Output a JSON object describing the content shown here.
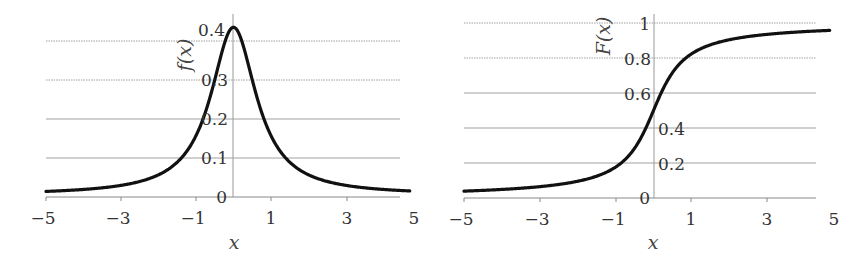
{
  "chart_data": [
    {
      "type": "line",
      "title": "",
      "xlabel": "x",
      "ylabel": "f(x)",
      "xlim": [
        -5,
        5
      ],
      "ylim": [
        0,
        0.43
      ],
      "x_ticks": [
        "−5",
        "−3",
        "−1",
        "1",
        "3",
        "5"
      ],
      "y_ticks": [
        "0",
        "0.1",
        "0.2",
        "0.3",
        "0.4"
      ],
      "grid": "horizontal",
      "legend": "none",
      "series": [
        {
          "name": "f(x)",
          "description": "Symmetric bell-shaped density with heavy tails (Cauchy-like), peak ~0.43 at x ≈ 0",
          "x": [
            -5,
            -4,
            -3,
            -2,
            -1.5,
            -1,
            -0.5,
            0,
            0.5,
            1,
            1.5,
            2,
            3,
            4,
            4.7
          ],
          "y": [
            0.012,
            0.018,
            0.03,
            0.06,
            0.09,
            0.14,
            0.27,
            0.43,
            0.27,
            0.14,
            0.09,
            0.06,
            0.03,
            0.018,
            0.014
          ]
        }
      ]
    },
    {
      "type": "line",
      "title": "",
      "xlabel": "x",
      "ylabel": "F(x)",
      "xlim": [
        -5,
        5
      ],
      "ylim": [
        0,
        1
      ],
      "x_ticks": [
        "−5",
        "−3",
        "−1",
        "1",
        "3",
        "5"
      ],
      "y_ticks": [
        "0",
        "0.2",
        "0.4",
        "0.6",
        "0.8",
        "1"
      ],
      "grid": "horizontal",
      "legend": "none",
      "series": [
        {
          "name": "F(x)",
          "description": "Cumulative distribution function, S-shaped, F(0) ≈ 0.5",
          "x": [
            -5,
            -4,
            -3,
            -2,
            -1.5,
            -1,
            -0.5,
            0,
            0.5,
            1,
            1.5,
            2,
            3,
            4,
            4.7
          ],
          "y": [
            0.06,
            0.075,
            0.1,
            0.15,
            0.19,
            0.25,
            0.35,
            0.5,
            0.65,
            0.75,
            0.81,
            0.85,
            0.9,
            0.925,
            0.94
          ]
        }
      ]
    }
  ],
  "left_chart": {
    "ylabel": "f(x)",
    "xlabel": "x",
    "x_ticks": [
      "−5",
      "−3",
      "−1",
      "1",
      "3",
      "5"
    ],
    "y_ticks": [
      "0",
      "0.1",
      "0.2",
      "0.3",
      "0.4"
    ]
  },
  "right_chart": {
    "ylabel": "F(x)",
    "xlabel": "x",
    "x_ticks": [
      "−5",
      "−3",
      "−1",
      "1",
      "3",
      "5"
    ],
    "y_ticks": [
      "0",
      "0.2",
      "0.4",
      "0.6",
      "0.8",
      "1"
    ]
  },
  "colors": {
    "curve": "#111111",
    "grid": "#999999",
    "axis": "#888888",
    "text": "#333333"
  }
}
